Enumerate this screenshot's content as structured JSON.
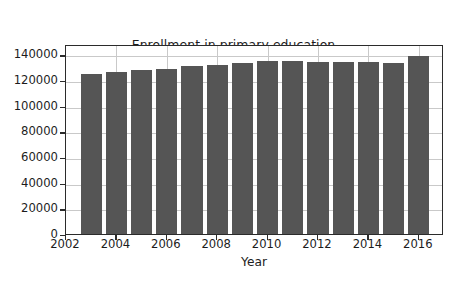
{
  "chart_data": {
    "type": "bar",
    "title": "Enrollment in primary education in India (in thousands)",
    "title_lines": [
      "Enrollment in primary education",
      "in India (in thousands)"
    ],
    "xlabel": "Year",
    "ylabel": "",
    "categories": [
      2003,
      2004,
      2005,
      2006,
      2007,
      2008,
      2009,
      2010,
      2011,
      2012,
      2013,
      2014,
      2015,
      2016
    ],
    "values": [
      125000,
      126000,
      127500,
      128500,
      130500,
      132000,
      133000,
      134500,
      134500,
      134000,
      134000,
      134000,
      133000,
      138500
    ],
    "series": [
      {
        "name": "Enrollment in primary education in India (in thousands)",
        "values": [
          125000,
          126000,
          127500,
          128500,
          130500,
          132000,
          133000,
          134500,
          134500,
          134000,
          134000,
          134000,
          133000,
          138500
        ]
      }
    ],
    "xlim": [
      2002,
      2017
    ],
    "ylim": [
      0,
      148000
    ],
    "yticks": [
      0,
      20000,
      40000,
      60000,
      80000,
      100000,
      120000,
      140000
    ],
    "ytick_labels": [
      "0",
      "20000",
      "40000",
      "60000",
      "80000",
      "100000",
      "120000",
      "140000"
    ],
    "xticks": [
      2002,
      2004,
      2006,
      2008,
      2010,
      2012,
      2014,
      2016
    ],
    "xtick_labels": [
      "2002",
      "2004",
      "2006",
      "2008",
      "2010",
      "2012",
      "2014",
      "2016"
    ],
    "grid": true,
    "grid_axis": "both",
    "legend": false,
    "legend_position": "none",
    "bar_color": "#555555",
    "bar_width_years": 0.84,
    "grid_color": "#c9c9c9",
    "axis_color": "#2b2b2b",
    "text_color": "#1c1c1c",
    "background_color": "#ffffff"
  }
}
